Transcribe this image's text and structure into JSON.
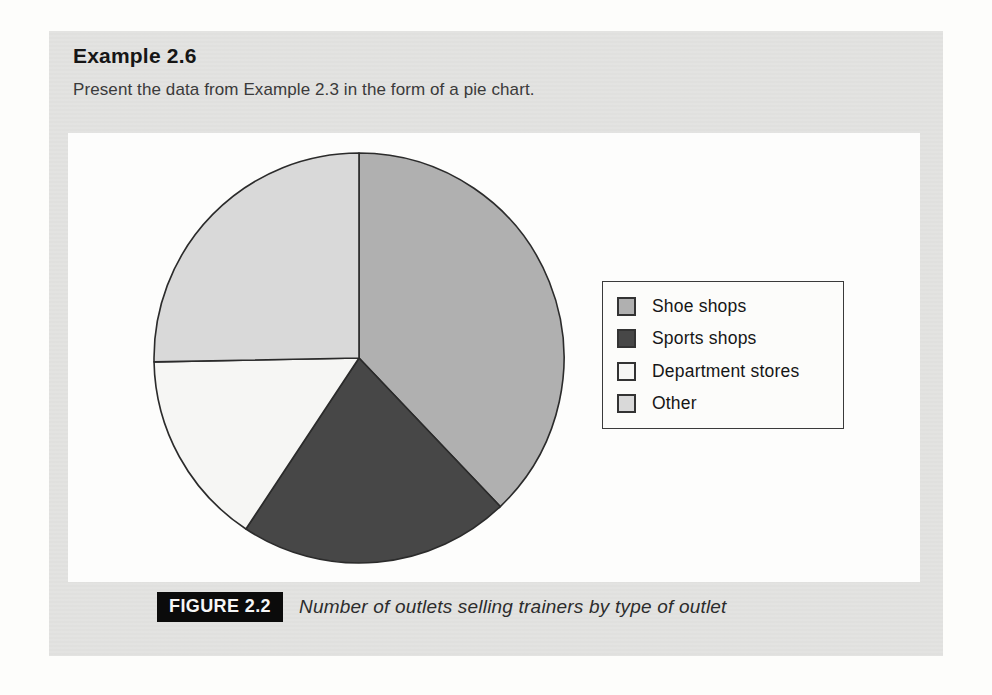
{
  "example": {
    "title": "Example 2.6",
    "body": "Present the data from Example 2.3 in the form of a pie chart."
  },
  "figure": {
    "label": "FIGURE 2.2",
    "caption": "Number of outlets selling trainers by type of outlet"
  },
  "colors": {
    "panel_bg": "#e3e3e1",
    "figure_bg": "#fdfdfc",
    "pie_stroke": "#2b2b2b",
    "legend_border": "#3a3a3a",
    "badge_bg": "#0b0b0b",
    "badge_text": "#f6f6f6"
  },
  "chart_data": {
    "type": "pie",
    "title": "",
    "labels": [
      "Shoe shops",
      "Sports shops",
      "Department stores",
      "Other"
    ],
    "values_percent": [
      37.9,
      21.4,
      15.4,
      25.3
    ],
    "slice_angles_deg": [
      136.4,
      77.1,
      55.4,
      91.1
    ],
    "start_angle_deg": 0,
    "direction": "clockwise",
    "slice_colors": [
      "#b0b0b0",
      "#474747",
      "#f6f6f4",
      "#d9d9d9"
    ],
    "legend_position": "right",
    "data_labels_shown": false
  }
}
